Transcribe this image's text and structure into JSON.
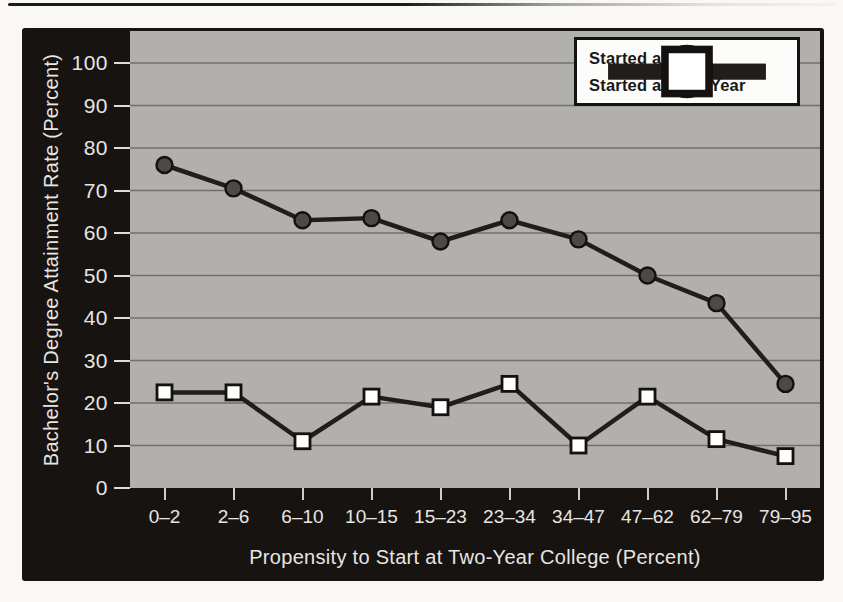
{
  "figure": {
    "frame_color": "#171310",
    "plot_bg": "#b2b0ac",
    "gridline_color": "#71706c",
    "tick_color": "#dedcd8",
    "label_color": "#e7e5e1",
    "legend_bg": "#fcfcfb",
    "legend_border": "#131313"
  },
  "chart_data": {
    "type": "line",
    "title": "",
    "xlabel": "Propensity to Start at Two-Year College (Percent)",
    "ylabel": "Bachelor's Degree Attainment Rate (Percent)",
    "categories": [
      "0–2",
      "2–6",
      "6–10",
      "10–15",
      "15–23",
      "23–34",
      "34–47",
      "47–62",
      "62–79",
      "79–95"
    ],
    "ylim": [
      0,
      100
    ],
    "yticks": [
      0,
      10,
      20,
      30,
      40,
      50,
      60,
      70,
      80,
      90,
      100
    ],
    "grid": "horizontal",
    "legend_position": "top-right",
    "series": [
      {
        "name": "Started at PWI",
        "marker": "circle",
        "marker_fill": "#4c4a47",
        "line_color": "#201d1a",
        "values": [
          76,
          70.5,
          63,
          63.5,
          58,
          63,
          58.5,
          50,
          43.5,
          24.5
        ]
      },
      {
        "name": "Started at Two-Year",
        "marker": "square",
        "marker_fill": "#ffffff",
        "line_color": "#201d1a",
        "values": [
          22.5,
          22.5,
          11,
          21.5,
          19,
          24.5,
          10,
          21.5,
          11.5,
          7.5
        ]
      }
    ]
  }
}
